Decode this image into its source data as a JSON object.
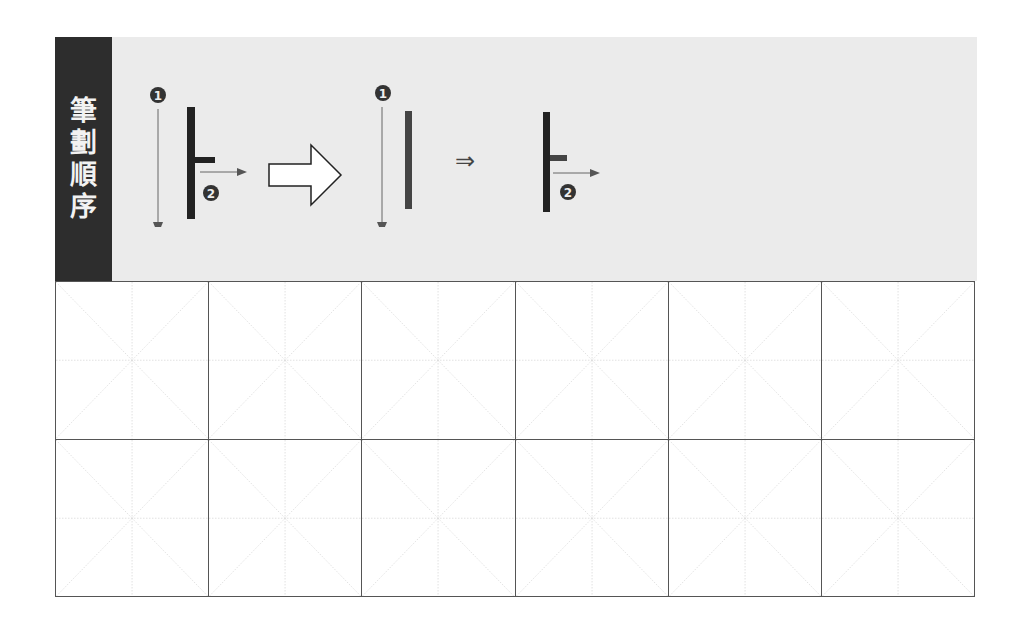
{
  "header": {
    "label_chars": [
      "筆",
      "劃",
      "順",
      "序"
    ]
  },
  "stroke_order": {
    "step_markers": [
      "❶",
      "❷"
    ],
    "big_arrow": "right-outline-arrow",
    "small_arrow": "⇒"
  },
  "practice_grid": {
    "columns": 6,
    "rows": 2,
    "guide_style": "米字格 dotted guides"
  },
  "colors": {
    "label_bg": "#2d2d2d",
    "banner_bg": "#ebebeb",
    "stroke_dark": "#222222",
    "stroke_mid": "#555555",
    "guide": "#cccccc"
  }
}
